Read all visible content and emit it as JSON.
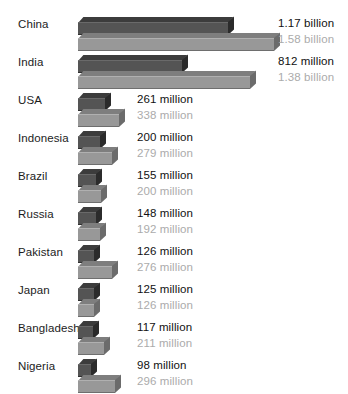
{
  "chart_data": {
    "type": "bar",
    "orientation": "horizontal",
    "title": "",
    "subtitle": "",
    "xlabel": "",
    "ylabel": "",
    "grid": false,
    "legend_position": "none",
    "axis_visible": false,
    "value_unit": "people",
    "xlim": [
      0,
      1580000000
    ],
    "categories": [
      "China",
      "India",
      "USA",
      "Indonesia",
      "Brazil",
      "Russia",
      "Pakistan",
      "Japan",
      "Bangladesh",
      "Nigeria"
    ],
    "series": [
      {
        "name": "current",
        "color": "#545454",
        "values": [
          1170000000,
          812000000,
          261000000,
          200000000,
          155000000,
          148000000,
          126000000,
          125000000,
          117000000,
          98000000
        ],
        "labels": [
          "1.17 billion",
          "812 million",
          "261 million",
          "200 million",
          "155 million",
          "148 million",
          "126 million",
          "125 million",
          "117 million",
          "98 million"
        ]
      },
      {
        "name": "projected",
        "color": "#989898",
        "values": [
          1580000000,
          1380000000,
          338000000,
          279000000,
          200000000,
          192000000,
          276000000,
          126000000,
          211000000,
          296000000
        ],
        "labels": [
          "1.58 billion",
          "1.38 billion",
          "338 million",
          "279 million",
          "200 million",
          "192 million",
          "276 million",
          "126 million",
          "211 million",
          "296 million"
        ]
      }
    ]
  },
  "rows": [
    {
      "country": "China",
      "primary_label": "1.17 billion",
      "secondary_label": "1.58 billion",
      "primary_width": 150,
      "secondary_width": 196,
      "label_x": 278
    },
    {
      "country": "India",
      "primary_label": "812 million",
      "secondary_label": "1.38 billion",
      "primary_width": 104,
      "secondary_width": 172,
      "label_x": 278
    },
    {
      "country": "USA",
      "primary_label": "261 million",
      "secondary_label": "338 million",
      "primary_width": 27,
      "secondary_width": 41,
      "label_x": 137
    },
    {
      "country": "Indonesia",
      "primary_label": "200 million",
      "secondary_label": "279 million",
      "primary_width": 22,
      "secondary_width": 34,
      "label_x": 137
    },
    {
      "country": "Brazil",
      "primary_label": "155 million",
      "secondary_label": "200 million",
      "primary_width": 18,
      "secondary_width": 23,
      "label_x": 137
    },
    {
      "country": "Russia",
      "primary_label": "148 million",
      "secondary_label": "192 million",
      "primary_width": 18,
      "secondary_width": 22,
      "label_x": 137
    },
    {
      "country": "Pakistan",
      "primary_label": "126 million",
      "secondary_label": "276 million",
      "primary_width": 16,
      "secondary_width": 34,
      "label_x": 137
    },
    {
      "country": "Japan",
      "primary_label": "125 million",
      "secondary_label": "126 million",
      "primary_width": 16,
      "secondary_width": 16,
      "label_x": 137
    },
    {
      "country": "Bangladesh",
      "primary_label": "117 million",
      "secondary_label": "211 million",
      "primary_width": 15,
      "secondary_width": 26,
      "label_x": 137
    },
    {
      "country": "Nigeria",
      "primary_label": "98 million",
      "secondary_label": "296 million",
      "primary_width": 13,
      "secondary_width": 37,
      "label_x": 137
    }
  ],
  "colors": {
    "primary_bar": "#545454",
    "secondary_bar": "#989898",
    "primary_text": "#111111",
    "secondary_text": "#ababab",
    "country_text": "#1c1c1c",
    "background": "#ffffff"
  },
  "layout": {
    "row_height": 38,
    "first_row_top": 14,
    "bars_left": 78
  }
}
